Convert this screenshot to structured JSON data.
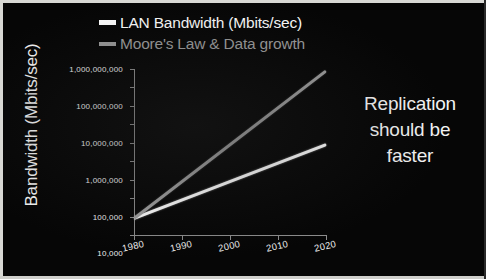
{
  "chart_data": {
    "type": "line",
    "title": "",
    "xlabel": "",
    "ylabel": "Bandwidth (Mbits/sec)",
    "yscale": "log",
    "ylim": [
      1,
      1000000000
    ],
    "xlim": [
      1980,
      2020
    ],
    "grid": false,
    "legend_position": "top",
    "x": [
      1980,
      2020
    ],
    "series": [
      {
        "name": "LAN Bandwidth (Mbits/sec)",
        "color": "#ffffff",
        "values": [
          10,
          100000
        ]
      },
      {
        "name": "Moore's Law & Data growth",
        "color": "#9e9e9e",
        "values": [
          10,
          1000000000
        ]
      }
    ],
    "ytick_labels": [
      "1,000,000,000",
      "100,000,000",
      "10,000,000",
      "1,000,000",
      "100,000",
      "10,000",
      "1,000",
      "100",
      "10",
      "1"
    ],
    "ytick_values": [
      1000000000,
      100000000,
      10000000,
      1000000,
      100000,
      10000,
      1000,
      100,
      10,
      1
    ],
    "xtick_labels": [
      "1980",
      "1990",
      "2000",
      "2010",
      "2020"
    ],
    "xtick_values": [
      1980,
      1990,
      2000,
      2010,
      2020
    ],
    "annotations": [
      {
        "text_lines": [
          "Replication",
          "should be",
          "faster"
        ],
        "color": "#f4f4f4"
      }
    ]
  },
  "legend": {
    "items": [
      {
        "label": "LAN Bandwidth (Mbits/sec)",
        "color": "#ffffff"
      },
      {
        "label": "Moore's Law & Data growth",
        "color": "#9e9e9e"
      }
    ]
  },
  "axes": {
    "y_title": "Bandwidth (Mbits/sec)"
  },
  "annotation": {
    "line1": "Replication",
    "line2": "should be",
    "line3": "faster"
  },
  "colors": {
    "background": "#050505",
    "frame": "#d8d8d4",
    "axis": "#8c8c8c",
    "tick_text": "#ededed",
    "series_primary": "#ffffff",
    "series_secondary": "#9e9e9e"
  }
}
